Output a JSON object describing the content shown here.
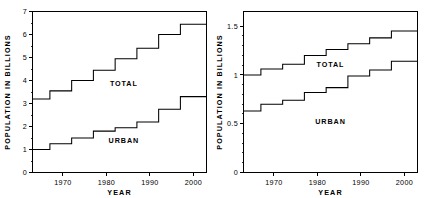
{
  "figure": {
    "background_color": "#ffffff",
    "line_color": "#000000",
    "panel_count": 2
  },
  "chart_data": [
    {
      "id": "world-population",
      "type": "line",
      "step": "post",
      "title": "",
      "subtitle": "",
      "xlabel": "YEAR",
      "ylabel": "POPULATION IN BILLIONS",
      "xlim": [
        1963,
        2003
      ],
      "ylim": [
        0,
        7
      ],
      "grid": false,
      "legend": "inline-annotation",
      "xticks": [
        1970,
        1980,
        1990,
        2000
      ],
      "xticklabels": [
        "1970",
        "1980",
        "1990",
        "2000"
      ],
      "yticks": [
        0,
        1,
        2,
        3,
        4,
        5,
        6,
        7
      ],
      "yticklabels": [
        "0",
        "1",
        "2",
        "3",
        "4",
        "5",
        "6",
        "7"
      ],
      "x": [
        1963,
        1967,
        1972,
        1977,
        1982,
        1987,
        1992,
        1997,
        2003
      ],
      "series": [
        {
          "name": "TOTAL",
          "label": "TOTAL",
          "label_x": 1984,
          "label_y": 3.75,
          "values": [
            3.2,
            3.55,
            4.0,
            4.45,
            4.95,
            5.4,
            6.0,
            6.45,
            6.45
          ]
        },
        {
          "name": "URBAN",
          "label": "URBAN",
          "label_x": 1984,
          "label_y": 1.28,
          "values": [
            1.0,
            1.25,
            1.5,
            1.8,
            1.95,
            2.2,
            2.75,
            3.3,
            3.3
          ]
        }
      ]
    },
    {
      "id": "developed-population",
      "type": "line",
      "step": "post",
      "title": "",
      "subtitle": "",
      "xlabel": "YEAR",
      "ylabel": "POPULATION IN BILLIONS",
      "xlim": [
        1963,
        2003
      ],
      "ylim": [
        0,
        1.65
      ],
      "grid": false,
      "legend": "inline-annotation",
      "xticks": [
        1970,
        1980,
        1990,
        2000
      ],
      "xticklabels": [
        "1970",
        "1980",
        "1990",
        "2000"
      ],
      "yticks": [
        0,
        0.5,
        1,
        1.5
      ],
      "yticklabels": [
        "0",
        "0.5",
        "1",
        "1.5"
      ],
      "x": [
        1963,
        1967,
        1972,
        1977,
        1982,
        1987,
        1992,
        1997,
        2003
      ],
      "series": [
        {
          "name": "TOTAL",
          "label": "TOTAL",
          "label_x": 1983,
          "label_y": 1.08,
          "values": [
            1.0,
            1.06,
            1.11,
            1.2,
            1.26,
            1.32,
            1.38,
            1.45,
            1.45
          ]
        },
        {
          "name": "URBAN",
          "label": "URBAN",
          "label_x": 1983,
          "label_y": 0.5,
          "values": [
            0.63,
            0.7,
            0.74,
            0.82,
            0.87,
            0.99,
            1.05,
            1.14,
            1.14
          ]
        }
      ]
    }
  ]
}
